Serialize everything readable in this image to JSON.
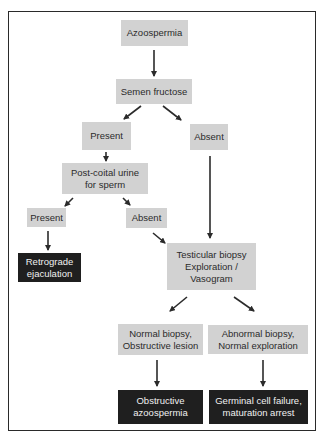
{
  "diagram": {
    "type": "flowchart",
    "colors": {
      "decision_box": "#d2d2d2",
      "outcome_box": "#1f1f1f",
      "outcome_text": "#f0f0f0",
      "text": "#2b2b2b",
      "arrow": "#2b2b2b",
      "frame": "#2a2a2a"
    },
    "nodes": {
      "azoospermia": "Azoospermia",
      "semen_fructose": "Semen fructose",
      "fructose_present": "Present",
      "fructose_absent": "Absent",
      "post_coital_urine": "Post-coital urine\nfor sperm",
      "urine_present": "Present",
      "urine_absent": "Absent",
      "retrograde_ejaculation": "Retrograde\nejaculation",
      "testicular_biopsy": "Testicular biopsy\nExploration /\nVasogram",
      "normal_biopsy": "Normal biopsy,\nObstructive lesion",
      "abnormal_biopsy": "Abnormal biopsy,\nNormal exploration",
      "obstructive_azoospermia": "Obstructive\nazoospermia",
      "germinal_cell_failure": "Germinal cell failure,\nmaturation arrest"
    },
    "edges": [
      {
        "from": "Azoospermia",
        "to": "Semen fructose"
      },
      {
        "from": "Semen fructose",
        "to": "Present"
      },
      {
        "from": "Semen fructose",
        "to": "Absent"
      },
      {
        "from": "Present",
        "to": "Post-coital urine for sperm"
      },
      {
        "from": "Absent",
        "to": "Testicular biopsy Exploration / Vasogram"
      },
      {
        "from": "Post-coital urine for sperm",
        "to": "Present"
      },
      {
        "from": "Post-coital urine for sperm",
        "to": "Absent"
      },
      {
        "from": "Present",
        "to": "Retrograde ejaculation"
      },
      {
        "from": "Absent",
        "to": "Testicular biopsy Exploration / Vasogram"
      },
      {
        "from": "Testicular biopsy Exploration / Vasogram",
        "to": "Normal biopsy, Obstructive lesion"
      },
      {
        "from": "Testicular biopsy Exploration / Vasogram",
        "to": "Abnormal biopsy, Normal exploration"
      },
      {
        "from": "Normal biopsy, Obstructive lesion",
        "to": "Obstructive azoospermia"
      },
      {
        "from": "Abnormal biopsy, Normal exploration",
        "to": "Germinal cell failure, maturation arrest"
      }
    ]
  }
}
